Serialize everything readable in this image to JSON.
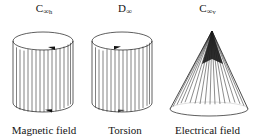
{
  "figure": {
    "title_present": false,
    "background_color": "#ffffff",
    "stroke_color": "#1a1a1a",
    "panels": [
      {
        "id": "magnetic",
        "symmetry_label": {
          "base": "C",
          "subscript_infinity": "∞",
          "subscript_suffix": "h",
          "full": "C∞h"
        },
        "caption": "Magnetic field",
        "shape": "cylinder",
        "arrows": [
          {
            "position": "top",
            "direction": "left"
          },
          {
            "position": "bottom",
            "direction": "left"
          }
        ]
      },
      {
        "id": "torsion",
        "symmetry_label": {
          "base": "D",
          "subscript_infinity": "∞",
          "subscript_suffix": "",
          "full": "D∞"
        },
        "caption": "Torsion",
        "shape": "cylinder",
        "arrows": [
          {
            "position": "top",
            "direction": "right"
          },
          {
            "position": "bottom",
            "direction": "right"
          }
        ]
      },
      {
        "id": "electric",
        "symmetry_label": {
          "base": "C",
          "subscript_infinity": "∞",
          "subscript_suffix": "v",
          "full": "C∞v"
        },
        "caption": "Electrical field",
        "shape": "cone",
        "arrows": []
      }
    ]
  }
}
